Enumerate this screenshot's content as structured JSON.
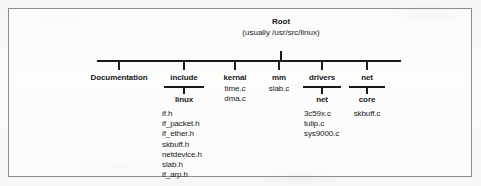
{
  "figure": {
    "type": "tree-diagram",
    "root": {
      "label": "Root",
      "sublabel": "(usually /usr/src/linux)"
    },
    "branches": [
      {
        "label": "Documentation",
        "x": 117,
        "child": null,
        "files": []
      },
      {
        "label": "include",
        "x": 182,
        "child": "linux",
        "files": [
          "if.h",
          "if_packet.h",
          "if_ether.h",
          "skbuff.h",
          "netdevice.h",
          "slab.h",
          "if_arp.h"
        ]
      },
      {
        "label": "kernal",
        "x": 233,
        "child": null,
        "files": [
          "time.c",
          "dma.c"
        ]
      },
      {
        "label": "mm",
        "x": 277,
        "child": null,
        "files": [
          "slab.c"
        ]
      },
      {
        "label": "drivers",
        "x": 320,
        "child": "net",
        "files": [
          "3c59x.c",
          "tulip.c",
          "sys9000.c"
        ]
      },
      {
        "label": "net",
        "x": 365,
        "child": "core",
        "files": [
          "skbuff.c"
        ]
      }
    ]
  },
  "colors": {
    "ink": "#1a1a1a",
    "frame_border": "#8c8c90",
    "paper": "#f7f7f6"
  }
}
